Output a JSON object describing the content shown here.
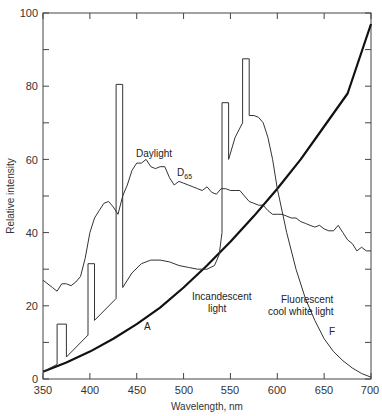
{
  "chart_data": {
    "type": "line",
    "title": "",
    "xlabel": "Wavelength, nm",
    "ylabel": "Relative intensity",
    "xlim": [
      350,
      700
    ],
    "ylim": [
      0,
      100
    ],
    "xticks": [
      350,
      400,
      450,
      500,
      550,
      600,
      650,
      700
    ],
    "yticks": [
      0,
      20,
      40,
      60,
      80,
      100
    ],
    "grid": false,
    "legend": "none (inline annotations)",
    "series": [
      {
        "name": "Daylight D65",
        "label": "Daylight",
        "sublabel": "D",
        "subscript": "65",
        "stroke_width": 1,
        "points": [
          [
            350,
            27
          ],
          [
            360,
            25
          ],
          [
            365,
            24
          ],
          [
            370,
            26
          ],
          [
            375,
            26
          ],
          [
            380,
            25.5
          ],
          [
            385,
            26.5
          ],
          [
            390,
            28
          ],
          [
            395,
            33
          ],
          [
            400,
            40
          ],
          [
            405,
            44
          ],
          [
            410,
            46
          ],
          [
            415,
            48
          ],
          [
            420,
            48.5
          ],
          [
            425,
            47
          ],
          [
            430,
            45
          ],
          [
            435,
            50
          ],
          [
            440,
            53
          ],
          [
            445,
            57
          ],
          [
            450,
            59
          ],
          [
            455,
            59
          ],
          [
            460,
            60
          ],
          [
            465,
            58
          ],
          [
            470,
            57.5
          ],
          [
            475,
            58
          ],
          [
            480,
            58
          ],
          [
            485,
            55
          ],
          [
            490,
            53
          ],
          [
            495,
            54
          ],
          [
            500,
            53.5
          ],
          [
            505,
            53
          ],
          [
            510,
            52.5
          ],
          [
            515,
            52
          ],
          [
            520,
            51.5
          ],
          [
            525,
            52.5
          ],
          [
            530,
            51
          ],
          [
            535,
            50.5
          ],
          [
            540,
            52
          ],
          [
            545,
            52
          ],
          [
            550,
            51.5
          ],
          [
            555,
            51.5
          ],
          [
            560,
            51.5
          ],
          [
            565,
            50
          ],
          [
            570,
            48.5
          ],
          [
            575,
            48
          ],
          [
            580,
            47.5
          ],
          [
            585,
            47.5
          ],
          [
            590,
            46
          ],
          [
            595,
            45
          ],
          [
            600,
            45
          ],
          [
            605,
            45
          ],
          [
            610,
            44.5
          ],
          [
            615,
            44
          ],
          [
            620,
            44
          ],
          [
            625,
            43
          ],
          [
            630,
            42.5
          ],
          [
            635,
            42
          ],
          [
            640,
            41.5
          ],
          [
            645,
            42
          ],
          [
            650,
            41
          ],
          [
            655,
            40.5
          ],
          [
            660,
            40.5
          ],
          [
            665,
            42
          ],
          [
            670,
            40
          ],
          [
            675,
            38
          ],
          [
            680,
            37
          ],
          [
            685,
            35
          ],
          [
            690,
            36
          ],
          [
            695,
            35
          ],
          [
            700,
            35
          ]
        ]
      },
      {
        "name": "Incandescent light A",
        "label": "Incandescent light",
        "curve_label": "A",
        "stroke_width": 2.2,
        "points": [
          [
            350,
            2
          ],
          [
            375,
            4.5
          ],
          [
            400,
            7.5
          ],
          [
            425,
            11
          ],
          [
            450,
            15
          ],
          [
            475,
            19.5
          ],
          [
            500,
            25
          ],
          [
            525,
            31
          ],
          [
            550,
            37.5
          ],
          [
            575,
            44.5
          ],
          [
            600,
            52
          ],
          [
            625,
            60
          ],
          [
            650,
            69
          ],
          [
            675,
            78
          ],
          [
            700,
            97
          ]
        ]
      },
      {
        "name": "Fluorescent cool white light F",
        "label": "Fluorescent cool white light",
        "curve_label": "F",
        "stroke_width": 1,
        "points": [
          [
            350,
            2
          ],
          [
            365,
            4
          ],
          [
            365,
            15
          ],
          [
            375,
            15
          ],
          [
            375,
            6
          ],
          [
            398,
            12
          ],
          [
            398,
            31.5
          ],
          [
            405,
            31.5
          ],
          [
            405,
            16
          ],
          [
            428,
            22
          ],
          [
            428,
            80.5
          ],
          [
            435,
            80.5
          ],
          [
            435,
            25
          ],
          [
            445,
            29
          ],
          [
            455,
            31.5
          ],
          [
            465,
            32.5
          ],
          [
            475,
            32.5
          ],
          [
            485,
            32
          ],
          [
            495,
            31
          ],
          [
            505,
            30.5
          ],
          [
            515,
            30
          ],
          [
            525,
            30
          ],
          [
            533,
            31
          ],
          [
            538,
            34
          ],
          [
            541,
            40
          ],
          [
            541,
            75.5
          ],
          [
            548,
            75.5
          ],
          [
            548,
            60
          ],
          [
            555,
            66
          ],
          [
            563,
            70
          ],
          [
            563,
            87.5
          ],
          [
            570,
            87.5
          ],
          [
            570,
            72
          ],
          [
            575,
            72
          ],
          [
            580,
            71.5
          ],
          [
            585,
            70
          ],
          [
            590,
            66
          ],
          [
            595,
            60
          ],
          [
            600,
            52
          ],
          [
            610,
            40
          ],
          [
            620,
            30
          ],
          [
            630,
            22
          ],
          [
            640,
            16
          ],
          [
            650,
            11
          ],
          [
            660,
            7.5
          ],
          [
            670,
            5
          ],
          [
            680,
            3
          ],
          [
            690,
            1.5
          ],
          [
            700,
            0.5
          ]
        ]
      }
    ],
    "annotations": [
      {
        "text": "Daylight",
        "x": 451,
        "y": 61
      },
      {
        "text": "D",
        "sub": "65",
        "x": 479,
        "y": 57
      },
      {
        "text": "Incandescent",
        "x": 493,
        "y": 22
      },
      {
        "text": "light",
        "x": 510,
        "y": 18
      },
      {
        "text": "A",
        "x": 456,
        "y": 9
      },
      {
        "text": "Fluorescent",
        "x": 594,
        "y": 21
      },
      {
        "text": "cool white light",
        "x": 579,
        "y": 17.5
      },
      {
        "text": "F",
        "x": 660,
        "y": 7
      }
    ]
  },
  "axes": {
    "x_title": "Wavelength, nm",
    "y_title": "Relative intensity",
    "x_tick_labels": [
      "350",
      "400",
      "450",
      "500",
      "550",
      "600",
      "650",
      "700"
    ],
    "y_tick_labels": [
      "0",
      "20",
      "40",
      "60",
      "80",
      "100"
    ]
  },
  "labels": {
    "daylight": "Daylight",
    "d65_main": "D",
    "d65_sub": "65",
    "incandescent_1": "Incandescent",
    "incandescent_2": "light",
    "curve_a": "A",
    "fluorescent_1": "Fluorescent",
    "fluorescent_2": "cool white light",
    "curve_f": "F"
  }
}
